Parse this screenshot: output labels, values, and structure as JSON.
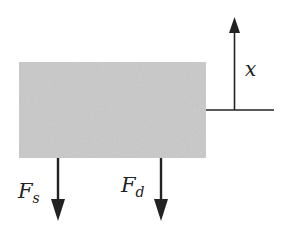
{
  "diagram": {
    "block": {
      "fill": "#c9c9c9"
    },
    "labels": {
      "x_axis": "x",
      "force_s_main": "F",
      "force_s_sub": "s",
      "force_d_main": "F",
      "force_d_sub": "d"
    },
    "colors": {
      "stroke": "#222222"
    }
  }
}
